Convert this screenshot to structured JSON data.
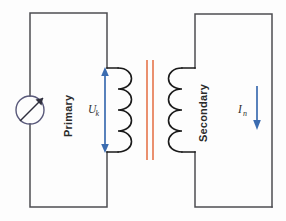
{
  "figure": {
    "kind": "circuit-diagram",
    "background_color": "#fdfdfd"
  },
  "colors": {
    "wire": "#4d4d52",
    "coil": "#1a1a1a",
    "core": "#e8845f",
    "arrow": "#3b6cb0",
    "source_outline": "#59597a",
    "text": "#2b2b2b"
  },
  "labels": {
    "primary_side": "Primary",
    "secondary_side": "Secondary",
    "voltage_symbol": "U",
    "voltage_subscript": "k",
    "current_symbol": "I",
    "current_subscript": "n"
  },
  "components": {
    "source": {
      "name": "variable-ac-source",
      "symbol": "circle-with-diagonal-arrow",
      "center_x": 30,
      "center_y": 110,
      "radius": 14
    },
    "primary_coil": {
      "name": "primary-winding",
      "turns": 4,
      "bump_direction": "right",
      "x": 118,
      "top_y": 68,
      "bottom_y": 152
    },
    "secondary_coil": {
      "name": "secondary-winding",
      "turns": 4,
      "bump_direction": "left",
      "x": 182,
      "top_y": 68,
      "bottom_y": 152
    },
    "core": {
      "name": "iron-core",
      "line_count": 2,
      "x_positions": [
        147,
        153
      ],
      "top_y": 60,
      "bottom_y": 160
    },
    "voltage_arrow": {
      "name": "voltage-measurement-arrow",
      "style": "double-headed-vertical",
      "x": 105,
      "top_y": 68,
      "bottom_y": 152
    },
    "current_arrow": {
      "name": "current-direction-arrow",
      "style": "single-headed-down",
      "x": 257,
      "top_y": 86,
      "bottom_y": 129
    }
  },
  "primary_loop": {
    "name": "primary-circuit-loop",
    "left_x": 30,
    "right_x": 107,
    "top_y": 13,
    "bottom_y": 207,
    "coil_top_y": 68,
    "coil_bottom_y": 152
  },
  "secondary_loop": {
    "name": "secondary-circuit-loop",
    "left_x": 195,
    "right_x": 272,
    "top_y": 14,
    "bottom_y": 207,
    "coil_top_y": 68,
    "coil_bottom_y": 152
  }
}
